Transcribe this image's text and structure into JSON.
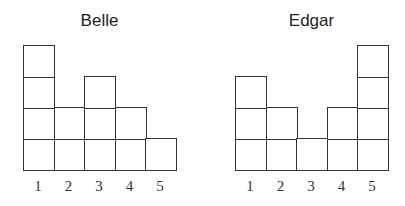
{
  "chart_data": [
    {
      "type": "bar",
      "title": "Belle",
      "categories": [
        "1",
        "2",
        "3",
        "4",
        "5"
      ],
      "values": [
        4,
        2,
        3,
        2,
        1
      ],
      "xlabel": "",
      "ylabel": "",
      "style": "stacked unit squares",
      "ylim": [
        0,
        4
      ],
      "grid": false
    },
    {
      "type": "bar",
      "title": "Edgar",
      "categories": [
        "1",
        "2",
        "3",
        "4",
        "5"
      ],
      "values": [
        3,
        2,
        1,
        2,
        4
      ],
      "xlabel": "",
      "ylabel": "",
      "style": "stacked unit squares",
      "ylim": [
        0,
        4
      ],
      "grid": false
    }
  ]
}
